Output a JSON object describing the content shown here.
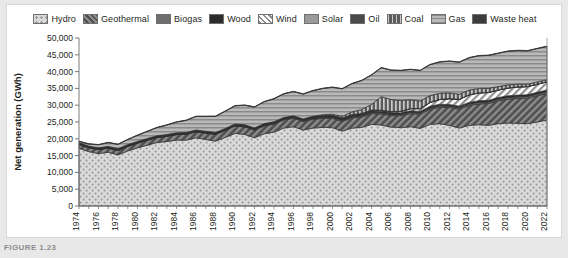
{
  "figure": {
    "caption": "FIGURE 1.23"
  },
  "legend": {
    "items": [
      {
        "label": "Hydro",
        "icon": "swatch-hydro",
        "pattern": "dots-light",
        "color": "#d2d2d2"
      },
      {
        "label": "Geothermal",
        "icon": "swatch-geothermal",
        "pattern": "diag-dark",
        "color": "#545454"
      },
      {
        "label": "Biogas",
        "icon": "swatch-biogas",
        "pattern": "solid",
        "color": "#6e6e6e"
      },
      {
        "label": "Wood",
        "icon": "swatch-wood",
        "pattern": "solid",
        "color": "#2b2b2b"
      },
      {
        "label": "Wind",
        "icon": "swatch-wind",
        "pattern": "diag-light",
        "color": "#e6e6e6"
      },
      {
        "label": "Solar",
        "icon": "swatch-solar",
        "pattern": "solid",
        "color": "#9a9a9a"
      },
      {
        "label": "Oil",
        "icon": "swatch-oil",
        "pattern": "solid",
        "color": "#4a4a4a"
      },
      {
        "label": "Coal",
        "icon": "swatch-coal",
        "pattern": "vert-dark",
        "color": "#595959"
      },
      {
        "label": "Gas",
        "icon": "swatch-gas",
        "pattern": "horiz-mid",
        "color": "#b4b4b4"
      },
      {
        "label": "Waste heat",
        "icon": "swatch-waste-heat",
        "pattern": "solid",
        "color": "#3c3c3c"
      }
    ]
  },
  "chart_data": {
    "type": "area",
    "stacked": true,
    "title": "",
    "xlabel": "Year",
    "ylabel": "Net generation (GWh)",
    "ylim": [
      0,
      50000
    ],
    "yticks": [
      0,
      5000,
      10000,
      15000,
      20000,
      25000,
      30000,
      35000,
      40000,
      45000,
      50000
    ],
    "yticklabels": [
      "0",
      "5,000",
      "10,000",
      "15,000",
      "20,000",
      "25,000",
      "30,000",
      "35,000",
      "40,000",
      "45,000",
      "50,000"
    ],
    "grid": false,
    "legend_position": "top",
    "x": [
      1974,
      1975,
      1976,
      1977,
      1978,
      1979,
      1980,
      1981,
      1982,
      1983,
      1984,
      1985,
      1986,
      1987,
      1988,
      1989,
      1990,
      1991,
      1992,
      1993,
      1994,
      1995,
      1996,
      1997,
      1998,
      1999,
      2000,
      2001,
      2002,
      2003,
      2004,
      2005,
      2006,
      2007,
      2008,
      2009,
      2010,
      2011,
      2012,
      2013,
      2014,
      2015,
      2016,
      2017,
      2018,
      2019,
      2020,
      2021,
      2022
    ],
    "xticklabels": [
      "1974",
      "1976",
      "1978",
      "1980",
      "1982",
      "1984",
      "1986",
      "1988",
      "1990",
      "1992",
      "1994",
      "1996",
      "1998",
      "2000",
      "2002",
      "2004",
      "2006",
      "2008",
      "2010",
      "2012",
      "2014",
      "2016",
      "2018",
      "2020",
      "2022"
    ],
    "series": [
      {
        "name": "Hydro",
        "values": [
          17200,
          16200,
          15600,
          16000,
          15200,
          16400,
          17300,
          18100,
          18900,
          19200,
          19600,
          19600,
          20300,
          19800,
          19300,
          20400,
          21600,
          21300,
          20300,
          21500,
          22000,
          23200,
          23600,
          22600,
          23200,
          23400,
          23300,
          22300,
          23200,
          23400,
          24300,
          24100,
          23500,
          23300,
          23600,
          23100,
          24300,
          24500,
          24000,
          23200,
          24000,
          24200,
          24000,
          24500,
          24700,
          24600,
          24500,
          25000,
          25600
        ]
      },
      {
        "name": "Geothermal",
        "values": [
          1100,
          1150,
          1200,
          1250,
          1300,
          1350,
          1400,
          1450,
          1500,
          1550,
          1650,
          1750,
          1800,
          1900,
          2000,
          2100,
          2200,
          2250,
          2300,
          2350,
          2400,
          2450,
          2500,
          2550,
          2600,
          2700,
          2800,
          2900,
          3000,
          3100,
          3200,
          3300,
          3400,
          3600,
          3900,
          4200,
          4500,
          4900,
          5300,
          5600,
          5900,
          6200,
          6500,
          6800,
          7100,
          7400,
          7600,
          7800,
          7900
        ]
      },
      {
        "name": "Biogas",
        "values": [
          0,
          0,
          0,
          0,
          0,
          0,
          0,
          0,
          0,
          0,
          10,
          20,
          30,
          40,
          60,
          80,
          100,
          120,
          140,
          160,
          180,
          200,
          220,
          240,
          260,
          280,
          300,
          310,
          320,
          330,
          340,
          350,
          360,
          370,
          380,
          390,
          400,
          410,
          420,
          430,
          440,
          450,
          460,
          470,
          480,
          490,
          500,
          510,
          520
        ]
      },
      {
        "name": "Wood",
        "values": [
          300,
          300,
          310,
          310,
          320,
          320,
          330,
          330,
          340,
          340,
          350,
          350,
          360,
          360,
          370,
          370,
          380,
          380,
          390,
          390,
          400,
          400,
          410,
          410,
          420,
          420,
          430,
          430,
          440,
          440,
          450,
          450,
          460,
          460,
          470,
          470,
          480,
          480,
          490,
          490,
          500,
          500,
          510,
          510,
          520,
          520,
          520,
          520,
          520
        ]
      },
      {
        "name": "Wind",
        "values": [
          0,
          0,
          0,
          0,
          0,
          0,
          0,
          0,
          0,
          0,
          0,
          0,
          0,
          0,
          0,
          0,
          0,
          0,
          0,
          0,
          0,
          0,
          0,
          0,
          30,
          60,
          90,
          120,
          150,
          180,
          210,
          250,
          300,
          400,
          600,
          800,
          1100,
          1400,
          1700,
          2000,
          2200,
          2300,
          2300,
          2200,
          2300,
          2400,
          2400,
          2400,
          2400
        ]
      },
      {
        "name": "Solar",
        "values": [
          0,
          0,
          0,
          0,
          0,
          0,
          0,
          0,
          0,
          0,
          0,
          0,
          0,
          0,
          0,
          0,
          0,
          0,
          0,
          0,
          0,
          0,
          0,
          0,
          0,
          0,
          0,
          0,
          0,
          0,
          0,
          0,
          0,
          0,
          0,
          0,
          0,
          0,
          0,
          0,
          0,
          0,
          0,
          0,
          0,
          0,
          0,
          0,
          0
        ]
      },
      {
        "name": "Oil",
        "values": [
          200,
          200,
          200,
          200,
          200,
          200,
          200,
          200,
          180,
          180,
          160,
          160,
          150,
          150,
          140,
          140,
          130,
          130,
          120,
          120,
          110,
          110,
          100,
          100,
          100,
          100,
          100,
          100,
          90,
          90,
          90,
          80,
          80,
          80,
          70,
          70,
          70,
          60,
          60,
          60,
          50,
          50,
          50,
          50,
          50,
          50,
          50,
          50,
          50
        ]
      },
      {
        "name": "Coal",
        "values": [
          0,
          0,
          0,
          0,
          0,
          0,
          0,
          0,
          0,
          0,
          0,
          0,
          0,
          0,
          0,
          0,
          0,
          0,
          0,
          0,
          0,
          0,
          0,
          0,
          100,
          200,
          300,
          500,
          800,
          1200,
          1600,
          4000,
          3600,
          3200,
          2600,
          2200,
          2000,
          1800,
          1700,
          1500,
          1400,
          1300,
          1200,
          1000,
          900,
          800,
          700,
          650,
          600
        ]
      },
      {
        "name": "Gas",
        "values": [
          400,
          600,
          900,
          1100,
          1300,
          1500,
          1800,
          2100,
          2400,
          2800,
          3200,
          3600,
          4000,
          4400,
          4800,
          5100,
          5400,
          5800,
          6200,
          6500,
          6800,
          7000,
          7200,
          7400,
          7600,
          7800,
          8000,
          8200,
          8400,
          8600,
          8800,
          8600,
          8700,
          8900,
          9000,
          9100,
          9200,
          9300,
          9400,
          9500,
          9600,
          9700,
          9800,
          9900,
          10000,
          10000,
          9900,
          9900,
          9900
        ]
      },
      {
        "name": "Waste heat",
        "values": [
          100,
          100,
          100,
          100,
          100,
          100,
          100,
          100,
          100,
          100,
          100,
          100,
          100,
          100,
          100,
          100,
          100,
          100,
          100,
          100,
          100,
          100,
          100,
          100,
          100,
          100,
          100,
          100,
          100,
          100,
          100,
          100,
          100,
          100,
          100,
          100,
          100,
          100,
          100,
          100,
          100,
          100,
          100,
          100,
          100,
          100,
          100,
          100,
          100
        ]
      }
    ]
  }
}
